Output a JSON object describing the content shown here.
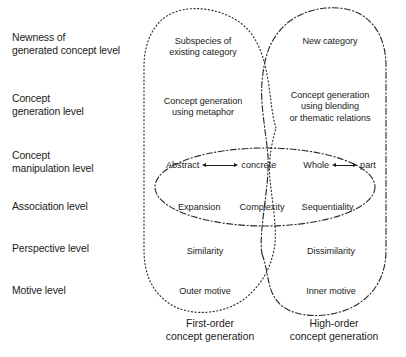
{
  "figure": {
    "colors": {
      "line": "#2b2b2b",
      "text": "#1b1b1b",
      "background": "#ffffff"
    }
  },
  "row_labels": [
    {
      "line1": "Newness of",
      "line2": "generated concept level"
    },
    {
      "line1": "Concept",
      "line2": "generation level"
    },
    {
      "line1": "Concept",
      "line2": "manipulation level"
    },
    {
      "line1": "Association level",
      "line2": ""
    },
    {
      "line1": "Perspective level",
      "line2": ""
    },
    {
      "line1": "Motive level",
      "line2": ""
    }
  ],
  "left_region": {
    "line_style": "dotted",
    "cells": [
      {
        "line1": "Subspecies of",
        "line2": "existing category"
      },
      {
        "line1": "Concept generation",
        "line2": "using metaphor"
      },
      {
        "line1": "Similarity",
        "line2": ""
      },
      {
        "line1": "Outer motive",
        "line2": ""
      }
    ],
    "caption": {
      "line1": "First-order",
      "line2": "concept generation"
    }
  },
  "right_region": {
    "line_style": "dash-dot",
    "cells": [
      {
        "line1": "New category",
        "line2": "",
        "line3": ""
      },
      {
        "line1": "Concept generation",
        "line2": "using blending",
        "line3": "or thematic relations"
      },
      {
        "line1": "Dissimilarity",
        "line2": "",
        "line3": ""
      },
      {
        "line1": "Inner motive",
        "line2": "",
        "line3": ""
      }
    ],
    "caption": {
      "line1": "High-order",
      "line2": "concept generation"
    }
  },
  "middle_ellipse": {
    "line_style": "dash-dot",
    "manipulation_pairs": [
      {
        "left": "Abstract",
        "right": "concrete",
        "arrow": "double-headed"
      },
      {
        "left": "Whole",
        "right": "part",
        "arrow": "double-headed"
      }
    ],
    "association_terms": [
      "Expansion",
      "Complexity",
      "Sequentiality"
    ]
  }
}
